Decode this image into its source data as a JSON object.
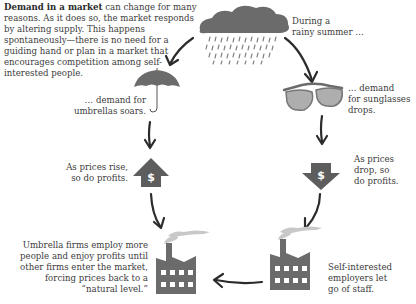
{
  "intro": {
    "bold": "Demand in a market",
    "rest": " can change for many reasons. As it does so, the market responds by altering supply. This happens spontaneously—there is no need for a guiding hand or plan in a market that encourages competition among self-interested people."
  },
  "captions": {
    "rain": [
      "During a",
      "rainy summer …"
    ],
    "umbrella": [
      "… demand for",
      "umbrellas soars."
    ],
    "sunglasses": [
      "… demand",
      "for sunglasses",
      "drops."
    ],
    "price_up": [
      "As prices rise,",
      "so do profits."
    ],
    "price_down": [
      "As prices",
      "drop, so",
      "do profits."
    ],
    "umbrella_firms": [
      "Umbrella firms employ more",
      "people and enjoy profits until",
      "other firms enter the market,",
      "forcing prices back to a",
      "“natural level.”"
    ],
    "sunglass_firms": [
      "Self-interested",
      "employers let",
      "go of staff."
    ]
  },
  "icons": {
    "cloud": "rain-cloud-icon",
    "umbrella": "umbrella-icon",
    "sunglasses": "sunglasses-icon",
    "price_up": "dollar-up-arrow-icon",
    "price_down": "dollar-down-arrow-icon",
    "factory_left": "factory-icon",
    "factory_right": "factory-icon",
    "dollar_glyph": "$"
  },
  "colors": {
    "icon_fill": "#6b6b6b",
    "icon_dark": "#5a5a5a",
    "arrow": "#2b2b2b",
    "smoke": "#bdbdbd",
    "text": "#3d3d3d"
  }
}
